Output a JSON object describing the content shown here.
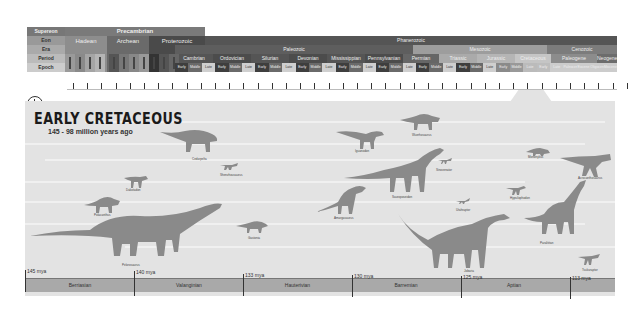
{
  "header": {
    "row_labels": [
      "Supereon",
      "Eon",
      "Era",
      "Period",
      "Epoch"
    ],
    "supereon": [
      {
        "label": "Precambrian",
        "color": "#6d6d6d"
      }
    ],
    "eons": [
      {
        "label": "Hadean",
        "color": "#8a8a8a"
      },
      {
        "label": "Archean",
        "color": "#6a6a6a"
      },
      {
        "label": "Proterozoic",
        "color": "#4a4a4a"
      },
      {
        "label": "Phanerozoic",
        "color": "#5c5c5c"
      }
    ],
    "eras": [
      {
        "label": "Paleozoic",
        "color": "#5a5a5a"
      },
      {
        "label": "Mesozoic",
        "color": "#9b9b9b"
      },
      {
        "label": "Cenozoic",
        "color": "#7a7a7a"
      }
    ],
    "periods": [
      {
        "label": "Cambrian"
      },
      {
        "label": "Ordovician"
      },
      {
        "label": "Silurian"
      },
      {
        "label": "Devonian"
      },
      {
        "label": "Mississippian"
      },
      {
        "label": "Pennsylvanian"
      },
      {
        "label": "Permian"
      },
      {
        "label": "Triassic"
      },
      {
        "label": "Jurassic"
      },
      {
        "label": "Cretaceous"
      },
      {
        "label": "Paleogene"
      },
      {
        "label": "Neogene"
      }
    ],
    "epochs": [
      "Early",
      "Middle",
      "Late",
      "Early",
      "Middle",
      "Late",
      "Early",
      "Middle",
      "Late",
      "Early",
      "Middle",
      "Late",
      "Early",
      "Middle",
      "Late",
      "Early",
      "Middle",
      "Late",
      "Early",
      "Middle",
      "Late",
      "Early",
      "Middle",
      "Late",
      "Early",
      "Middle",
      "Late",
      "Early",
      "Late",
      "Paleocene",
      "Eocene",
      "Oligocene",
      "Miocene"
    ],
    "selected_epoch": "Early Cretaceous"
  },
  "main": {
    "title": "EARLY CRETACEOUS",
    "subtitle": "145 - 98 million years ago",
    "dinosaurs": [
      {
        "name": "Cedarpelta"
      },
      {
        "name": "Iguanodon"
      },
      {
        "name": "Wuerhosaurus"
      },
      {
        "name": "Utahraptor"
      },
      {
        "name": "Pelorosaurus"
      },
      {
        "name": "Neovenator"
      },
      {
        "name": "Dakotadon"
      },
      {
        "name": "Shenzhousaurus"
      },
      {
        "name": "Polacanthus"
      },
      {
        "name": "Sauroposeidon"
      },
      {
        "name": "Mononykus"
      },
      {
        "name": "Acrocanthosaurus"
      },
      {
        "name": "Sinovenator"
      },
      {
        "name": "Hypsilophodon"
      },
      {
        "name": "Amargasaurus"
      },
      {
        "name": "Gastonia"
      },
      {
        "name": "Jobaria"
      },
      {
        "name": "Paralititan"
      },
      {
        "name": "Tsukuraptor"
      },
      {
        "name": "Minmi"
      }
    ],
    "boundaries": [
      "145 mya",
      "140 mya",
      "133 mya",
      "130 mya",
      "125 mya",
      "113 mya"
    ],
    "stages": [
      "Berriasian",
      "Valanginian",
      "Hauterivian",
      "Barremian",
      "Aptian"
    ]
  }
}
